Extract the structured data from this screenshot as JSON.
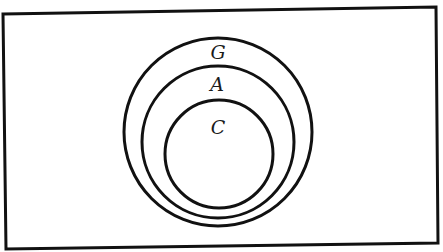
{
  "diagram": {
    "type": "venn-nested-sets",
    "stroke_color": "#111111",
    "background": "#ffffff",
    "universe": {
      "shape": "rectangle",
      "points": [
        [
          3,
          14
        ],
        [
          436,
          7
        ],
        [
          438,
          243
        ],
        [
          6,
          249
        ]
      ]
    },
    "sets": [
      {
        "label": "G",
        "cx": 218,
        "cy": 132,
        "r": 94,
        "label_x": 218,
        "label_y": 59
      },
      {
        "label": "A",
        "cx": 218,
        "cy": 142,
        "r": 76,
        "label_x": 217,
        "label_y": 91
      },
      {
        "label": "C",
        "cx": 219,
        "cy": 154,
        "r": 54,
        "label_x": 218,
        "label_y": 134
      }
    ],
    "relationships": [
      "C ⊂ A",
      "A ⊂ G"
    ]
  }
}
